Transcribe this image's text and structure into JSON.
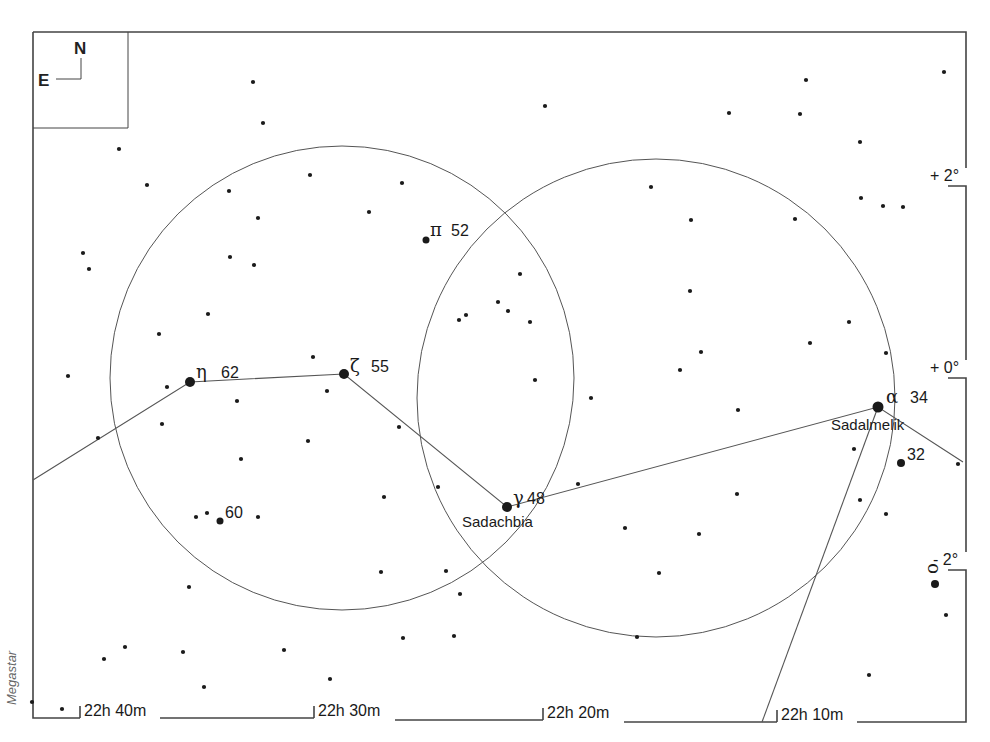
{
  "credit": "Megastar",
  "compass": {
    "north": "N",
    "east": "E"
  },
  "ra_labels": [
    {
      "label": "22h 40m",
      "x": 82
    },
    {
      "label": "22h 30m",
      "x": 314
    },
    {
      "label": "22h 20m",
      "x": 543
    },
    {
      "label": "22h 10m",
      "x": 777
    }
  ],
  "dec_labels": [
    {
      "label": "+ 2°",
      "y": 180
    },
    {
      "label": "+ 0°",
      "y": 372
    },
    {
      "label": "- 2°",
      "y": 564
    }
  ],
  "named_stars": [
    {
      "id": "eta",
      "greek": "η",
      "number": "62",
      "x": 190,
      "y": 382,
      "r": 5
    },
    {
      "id": "zeta",
      "greek": "ζ",
      "number": "55",
      "x": 344,
      "y": 374,
      "r": 5
    },
    {
      "id": "pi",
      "greek": "π",
      "number": "52",
      "x": 426,
      "y": 240,
      "r": 3.5
    },
    {
      "id": "gamma",
      "greek": "γ",
      "number": "48",
      "x": 507,
      "y": 507,
      "r": 5,
      "name": "Sadachbia"
    },
    {
      "id": "alpha",
      "greek": "α",
      "number": "34",
      "x": 878,
      "y": 407,
      "r": 5.5,
      "name": "Sadalmelik"
    },
    {
      "id": "32",
      "greek": "",
      "number": "32",
      "x": 901,
      "y": 463,
      "r": 4
    },
    {
      "id": "60",
      "greek": "",
      "number": "60",
      "x": 220,
      "y": 521,
      "r": 3.5
    },
    {
      "id": "omicron",
      "greek": "ο",
      "number": "",
      "x": 935,
      "y": 584,
      "r": 4
    }
  ],
  "stars": [
    [
      253,
      82
    ],
    [
      263,
      123
    ],
    [
      545,
      106
    ],
    [
      729,
      113
    ],
    [
      800,
      114
    ],
    [
      806,
      80
    ],
    [
      944,
      72
    ],
    [
      860,
      142
    ],
    [
      119,
      149
    ],
    [
      147,
      185
    ],
    [
      229,
      191
    ],
    [
      310,
      175
    ],
    [
      402,
      183
    ],
    [
      369,
      212
    ],
    [
      258,
      218
    ],
    [
      651,
      187
    ],
    [
      691,
      220
    ],
    [
      795,
      219
    ],
    [
      861,
      198
    ],
    [
      883,
      206
    ],
    [
      903,
      207
    ],
    [
      83,
      253
    ],
    [
      89,
      269
    ],
    [
      230,
      257
    ],
    [
      254,
      265
    ],
    [
      520,
      274
    ],
    [
      498,
      302
    ],
    [
      508,
      311
    ],
    [
      466,
      315
    ],
    [
      459,
      320
    ],
    [
      530,
      322
    ],
    [
      690,
      291
    ],
    [
      208,
      314
    ],
    [
      159,
      334
    ],
    [
      849,
      322
    ],
    [
      886,
      353
    ],
    [
      680,
      370
    ],
    [
      701,
      352
    ],
    [
      810,
      343
    ],
    [
      68,
      376
    ],
    [
      167,
      387
    ],
    [
      313,
      357
    ],
    [
      327,
      391
    ],
    [
      535,
      380
    ],
    [
      591,
      398
    ],
    [
      237,
      401
    ],
    [
      738,
      410
    ],
    [
      399,
      427
    ],
    [
      98,
      438
    ],
    [
      162,
      424
    ],
    [
      308,
      441
    ],
    [
      241,
      459
    ],
    [
      438,
      487
    ],
    [
      384,
      497
    ],
    [
      578,
      484
    ],
    [
      737,
      494
    ],
    [
      854,
      449
    ],
    [
      860,
      500
    ],
    [
      886,
      514
    ],
    [
      625,
      528
    ],
    [
      699,
      534
    ],
    [
      196,
      517
    ],
    [
      207,
      513
    ],
    [
      258,
      517
    ],
    [
      958,
      464
    ],
    [
      381,
      572
    ],
    [
      446,
      571
    ],
    [
      659,
      573
    ],
    [
      946,
      615
    ],
    [
      189,
      587
    ],
    [
      460,
      594
    ],
    [
      403,
      638
    ],
    [
      454,
      636
    ],
    [
      637,
      637
    ],
    [
      284,
      650
    ],
    [
      125,
      647
    ],
    [
      104,
      659
    ],
    [
      183,
      652
    ],
    [
      204,
      687
    ],
    [
      330,
      679
    ],
    [
      869,
      675
    ],
    [
      32,
      702
    ],
    [
      62,
      709
    ]
  ],
  "circles": [
    {
      "cx": 342,
      "cy": 378,
      "r": 232
    },
    {
      "cx": 656,
      "cy": 398,
      "r": 239
    }
  ],
  "constellation_lines": [
    [
      [
        33,
        480
      ],
      [
        190,
        382
      ],
      [
        344,
        374
      ],
      [
        507,
        507
      ],
      [
        878,
        407
      ],
      [
        963,
        462
      ]
    ],
    [
      [
        878,
        407
      ],
      [
        762,
        722
      ]
    ]
  ]
}
